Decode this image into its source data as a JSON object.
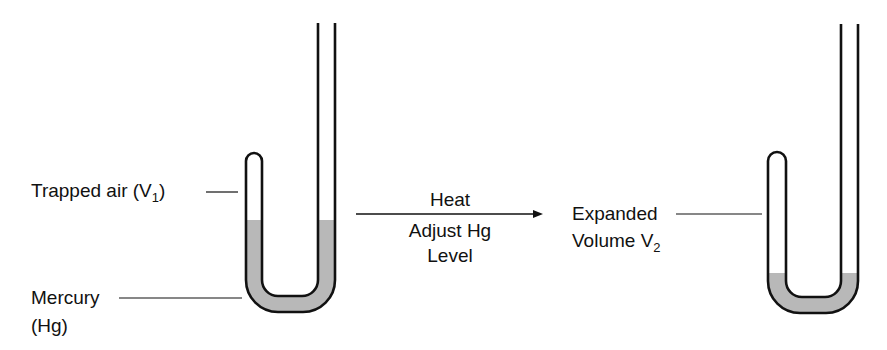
{
  "diagram": {
    "left_apparatus": {
      "labels": {
        "trapped_air": "Trapped air (V",
        "trapped_air_sub": "1",
        "trapped_air_close": ")",
        "mercury_line1": "Mercury",
        "mercury_line2": "(Hg)"
      }
    },
    "process": {
      "above_arrow": "Heat",
      "below_arrow_line1": "Adjust  Hg",
      "below_arrow_line2": "Level"
    },
    "right_apparatus": {
      "labels": {
        "expanded_line1": "Expanded",
        "expanded_line2": "Volume V",
        "expanded_sub": "2"
      }
    },
    "colors": {
      "stroke": "#111111",
      "mercury_fill": "#b8b8b8",
      "background": "#ffffff"
    }
  }
}
